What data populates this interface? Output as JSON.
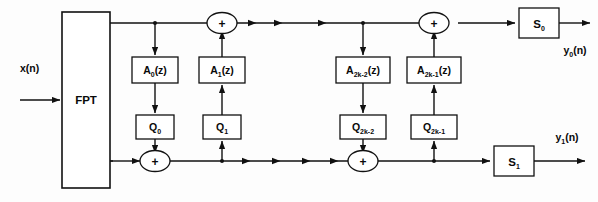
{
  "diagram": {
    "input": {
      "label": "x(n)",
      "name": "input-signal"
    },
    "transform_block": {
      "label": "FPT",
      "name": "fpt-block"
    },
    "allpass_blocks": [
      {
        "id": "a0",
        "base": "A",
        "subscript": "0",
        "suffix": "(z)",
        "label": "A₀(z)"
      },
      {
        "id": "a1",
        "base": "A",
        "subscript": "1",
        "suffix": "(z)",
        "label": "A₁(z)"
      },
      {
        "id": "a2k-2",
        "base": "A",
        "subscript": "2k-2",
        "suffix": "(z)",
        "label": "A₂ₖ₋₂(z)"
      },
      {
        "id": "a2k-1",
        "base": "A",
        "subscript": "2k-1",
        "suffix": "(z)",
        "label": "A₂ₖ₋₁(z)"
      }
    ],
    "quantizer_blocks": [
      {
        "id": "q0",
        "base": "Q",
        "subscript": "0",
        "label": "Q₀"
      },
      {
        "id": "q1",
        "base": "Q",
        "subscript": "1",
        "label": "Q₁"
      },
      {
        "id": "q2k-2",
        "base": "Q",
        "subscript": "2k-2",
        "label": "Q₂ₖ₋₂"
      },
      {
        "id": "q2k-1",
        "base": "Q",
        "subscript": "2k-1",
        "label": "Q₂ₖ₋₁"
      }
    ],
    "scaling_blocks": [
      {
        "id": "s0",
        "base": "S",
        "subscript": "0",
        "label": "S₀"
      },
      {
        "id": "s1",
        "base": "S",
        "subscript": "1",
        "label": "S₁"
      }
    ],
    "adders": [
      {
        "id": "sum-top-left",
        "symbol": "+"
      },
      {
        "id": "sum-top-right",
        "symbol": "+"
      },
      {
        "id": "sum-bottom-left",
        "symbol": "+"
      },
      {
        "id": "sum-bottom-right",
        "symbol": "+"
      }
    ],
    "outputs": [
      {
        "id": "y0",
        "base": "y",
        "subscript": "0",
        "suffix": "(n)",
        "label": "y₀(n)"
      },
      {
        "id": "y1",
        "base": "y",
        "subscript": "1",
        "suffix": "(n)",
        "label": "y₁(n)"
      }
    ],
    "colors": {
      "stroke": "#111111",
      "fill": "#ffffff",
      "background": "#fdfdfd",
      "text": "#0a0a0a"
    }
  }
}
